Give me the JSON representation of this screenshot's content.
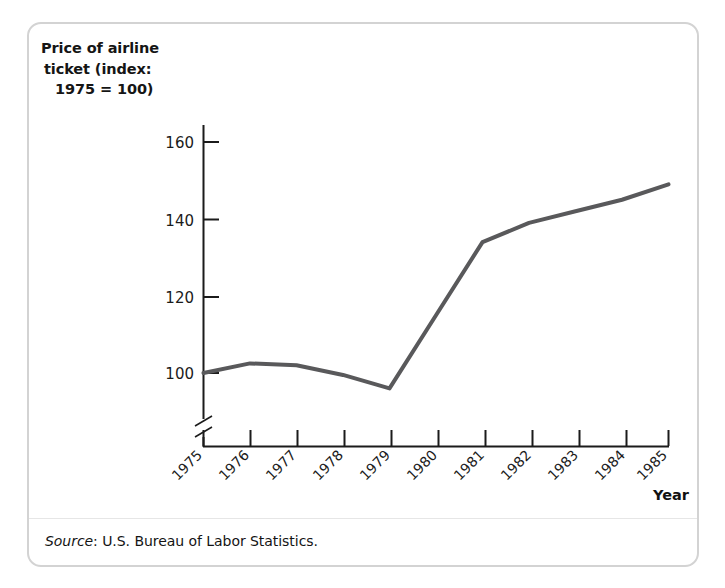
{
  "figure": {
    "y_axis_title_lines": [
      "Price of airline",
      "ticket (index:",
      "1975 = 100)"
    ],
    "x_axis_title": "Year",
    "source_label": "Source",
    "source_text": ": U.S. Bureau of Labor Statistics.",
    "line_color": "#59595b",
    "axis_color": "#1b1b1b",
    "frame_color": "#d3d3d3"
  },
  "chart_data": {
    "type": "line",
    "title": "",
    "subtitle": "",
    "xlabel": "Year",
    "ylabel": "Price of airline ticket (index: 1975 = 100)",
    "categories": [
      "1975",
      "1976",
      "1977",
      "1978",
      "1979",
      "1980",
      "1981",
      "1982",
      "1983",
      "1984",
      "1985"
    ],
    "x": [
      1975,
      1976,
      1977,
      1978,
      1979,
      1980,
      1981,
      1982,
      1983,
      1984,
      1985
    ],
    "values": [
      100,
      102.5,
      102,
      99.5,
      96,
      115,
      134,
      139,
      142,
      145,
      149
    ],
    "series": [
      {
        "name": "Price of airline ticket (index: 1975 = 100)",
        "values": [
          100,
          102.5,
          102,
          99.5,
          96,
          115,
          134,
          139,
          142,
          145,
          149
        ]
      }
    ],
    "ytick_labels": [
      "100",
      "120",
      "140",
      "160"
    ],
    "yticks": [
      100,
      120,
      140,
      160
    ],
    "ylim": [
      88,
      165
    ],
    "xlim": [
      1975,
      1985
    ],
    "grid": false,
    "legend": false,
    "axis_break": true,
    "annotations": []
  }
}
